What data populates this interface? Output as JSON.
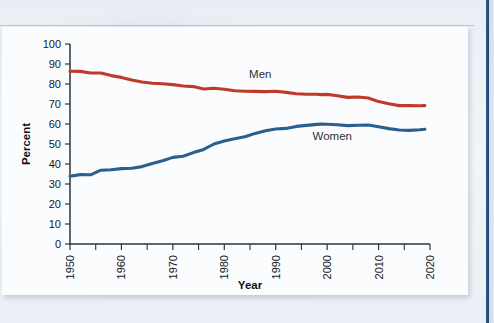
{
  "figure": {
    "panel_name": "chart-figure-panel",
    "background_color": "#fbfcfe",
    "page_background_color": "#eef1f6",
    "edge_stripe_color": "#2f5e8c"
  },
  "chart_data": {
    "type": "line",
    "title": "",
    "xlabel": "Year",
    "ylabel": "Percent",
    "xlim": [
      1950,
      2020
    ],
    "ylim": [
      0,
      100
    ],
    "grid": false,
    "legend_position": "inline-annotation",
    "x_major_ticks": [
      1950,
      1960,
      1970,
      1980,
      1990,
      2000,
      2010,
      2020
    ],
    "x_minor_ticks": [
      1955,
      1965,
      1975,
      1985,
      1995,
      2005,
      2015
    ],
    "x_tick_labels": [
      "1950",
      "1960",
      "1970",
      "1980",
      "1990",
      "2000",
      "2010",
      "2020"
    ],
    "y_ticks": [
      0,
      10,
      20,
      30,
      40,
      50,
      60,
      70,
      80,
      90,
      100
    ],
    "y_tick_labels": [
      "0",
      "10",
      "20",
      "30",
      "40",
      "50",
      "60",
      "70",
      "80",
      "90",
      "100"
    ],
    "x": [
      1950,
      1952,
      1954,
      1956,
      1958,
      1960,
      1962,
      1964,
      1966,
      1968,
      1970,
      1972,
      1974,
      1976,
      1978,
      1980,
      1982,
      1984,
      1986,
      1988,
      1990,
      1992,
      1994,
      1996,
      1998,
      1999,
      2000,
      2002,
      2004,
      2006,
      2008,
      2010,
      2012,
      2014,
      2016,
      2018,
      2019
    ],
    "series": [
      {
        "name": "Men",
        "color": "#c0392b",
        "label": "Men",
        "label_x": 1987,
        "label_y": 83,
        "values": [
          86.4,
          86.3,
          85.5,
          85.5,
          84.2,
          83.3,
          82.0,
          81.0,
          80.4,
          80.1,
          79.7,
          79.0,
          78.7,
          77.5,
          77.9,
          77.4,
          76.6,
          76.4,
          76.3,
          76.2,
          76.4,
          75.8,
          75.1,
          74.9,
          74.9,
          74.7,
          74.8,
          74.1,
          73.3,
          73.5,
          73.0,
          71.2,
          70.1,
          69.2,
          69.2,
          69.1,
          69.2
        ]
      },
      {
        "name": "Women",
        "color": "#2b5f8e",
        "label": "Women",
        "label_x": 2001,
        "label_y": 52,
        "values": [
          33.9,
          34.7,
          34.6,
          36.9,
          37.1,
          37.7,
          37.9,
          38.7,
          40.3,
          41.6,
          43.3,
          43.9,
          45.7,
          47.3,
          50.0,
          51.5,
          52.6,
          53.6,
          55.3,
          56.6,
          57.5,
          57.8,
          58.8,
          59.3,
          59.8,
          60.0,
          59.9,
          59.6,
          59.2,
          59.4,
          59.5,
          58.6,
          57.7,
          57.0,
          56.8,
          57.1,
          57.4
        ]
      }
    ]
  }
}
